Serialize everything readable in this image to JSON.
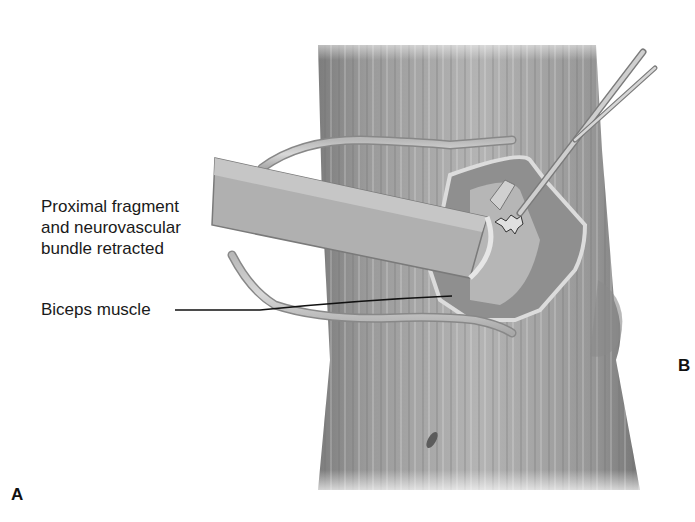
{
  "figure": {
    "type": "surgical-illustration",
    "colors": {
      "background": "#ffffff",
      "limb_shade": "#8c8c8c",
      "limb_highlight": "#c8c8c8",
      "retractor": "#d9d9d9",
      "leader_line": "#111111",
      "text": "#1a1a1a"
    }
  },
  "labels": {
    "proximal_line1": "Proximal fragment",
    "proximal_line2": "and neurovascular",
    "proximal_line3": "bundle retracted",
    "biceps": "Biceps muscle"
  },
  "panels": {
    "a": "A",
    "b": "B"
  }
}
